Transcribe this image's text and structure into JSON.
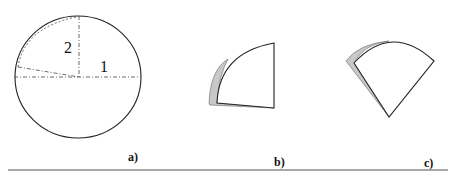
{
  "figure": {
    "panels": [
      {
        "id": "a",
        "caption": "a)",
        "labels": {
          "segment_2": "2",
          "segment_1": "1"
        },
        "description": "circle with dash-dot radii"
      },
      {
        "id": "b",
        "caption": "b)",
        "description": "quarter sector with gray shadow"
      },
      {
        "id": "c",
        "caption": "c)",
        "description": "rotated sector with gray shadow"
      }
    ],
    "colors": {
      "stroke": "#222222",
      "shadow_fill": "#c8c8c8",
      "rule": "#555555"
    }
  }
}
